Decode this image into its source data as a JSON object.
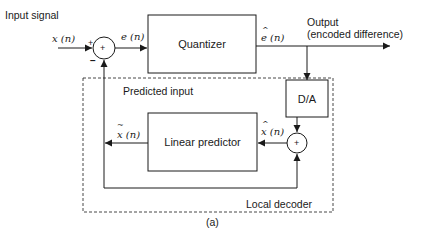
{
  "diagram": {
    "title_label": "Input signal",
    "input_symbol": "x (n)",
    "error_symbol_char": "e",
    "error_symbol_rest": " (n)",
    "quantizer_label": "Quantizer",
    "quantized_error_char": "e",
    "quantized_error_rest": " (n)",
    "output_label_line1": "Output",
    "output_label_line2": "(encoded difference)",
    "da_label": "D/A",
    "predicted_input_label": "Predicted input",
    "linear_predictor_label": "Linear predictor",
    "predicted_signal_char": "x",
    "predicted_signal_rest": " (n)",
    "reconstructed_char": "x",
    "reconstructed_rest": " (n)",
    "local_decoder_label": "Local decoder",
    "caption": "(a)",
    "sum1_plus": "+",
    "sum1_minus": "−",
    "sum1_symbol": "+",
    "sum2_symbol": "+"
  }
}
